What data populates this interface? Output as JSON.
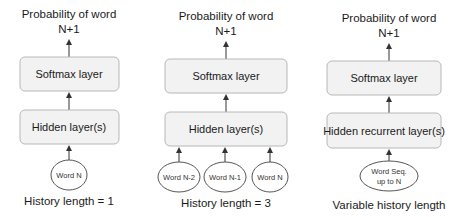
{
  "diagram": {
    "panels": [
      {
        "title_line1": "Probability of word",
        "title_line2": "N+1",
        "softmax_label": "Softmax layer",
        "hidden_label": "Hidden layer(s)",
        "inputs": [
          "Word N"
        ],
        "caption": "History length = 1"
      },
      {
        "title_line1": "Probability of word",
        "title_line2": "N+1",
        "softmax_label": "Softmax layer",
        "hidden_label": "Hidden layer(s)",
        "inputs": [
          "Word N-2",
          "Word N-1",
          "Word N"
        ],
        "caption": "History length = 3"
      },
      {
        "title_line1": "Probability of word",
        "title_line2": "N+1",
        "softmax_label": "Softmax layer",
        "hidden_label": "Hidden recurrent layer(s)",
        "inputs_line1": "Word Seq.",
        "inputs_line2": "up to N",
        "caption": "Variable history length"
      }
    ],
    "colors": {
      "box_fill": "#f2f2f2",
      "box_stroke": "#b8b8b8",
      "ellipse_stroke": "#555555",
      "text": "#1a1a1a"
    }
  }
}
